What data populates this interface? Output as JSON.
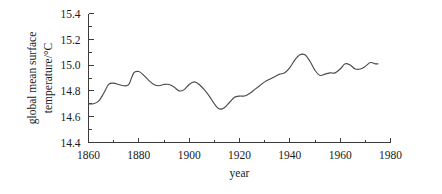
{
  "chart_data": {
    "type": "line",
    "title": "",
    "xlabel": "year",
    "ylabel": "global mean surface temperature/°C",
    "ylabel_line1": "global mean surface",
    "ylabel_line2": "temperature/°C",
    "xlim": [
      1860,
      1980
    ],
    "ylim": [
      14.4,
      15.4
    ],
    "xticks": [
      1860,
      1880,
      1900,
      1920,
      1940,
      1960,
      1980
    ],
    "xtick_labels": [
      "1860",
      "1880",
      "1900",
      "1920",
      "1940",
      "1960",
      "1980"
    ],
    "xminor_ticks": [
      1870,
      1890,
      1910,
      1930,
      1950,
      1970
    ],
    "yticks": [
      14.4,
      14.6,
      14.8,
      15.0,
      15.2,
      15.4
    ],
    "ytick_labels": [
      "14.4",
      "14.6",
      "14.8",
      "15.0",
      "15.2",
      "15.4"
    ],
    "yminor_ticks": [
      14.5,
      14.7,
      14.9,
      15.1,
      15.3
    ],
    "grid": false,
    "legend": false,
    "line_color": "#4a4a4a",
    "background_color": "#ffffff",
    "axis_color": "#3b3b3b",
    "series": [
      {
        "name": "global mean surface temperature",
        "x": [
          1860,
          1862,
          1864,
          1866,
          1868,
          1870,
          1872,
          1874,
          1876,
          1878,
          1880,
          1882,
          1884,
          1886,
          1888,
          1890,
          1892,
          1894,
          1896,
          1898,
          1900,
          1902,
          1904,
          1906,
          1908,
          1910,
          1912,
          1914,
          1916,
          1918,
          1920,
          1922,
          1924,
          1926,
          1928,
          1930,
          1932,
          1934,
          1936,
          1938,
          1940,
          1942,
          1944,
          1946,
          1948,
          1950,
          1952,
          1954,
          1956,
          1958,
          1960,
          1962,
          1964,
          1966,
          1968,
          1970,
          1972,
          1974,
          1975
        ],
        "y": [
          14.7,
          14.7,
          14.72,
          14.78,
          14.85,
          14.86,
          14.85,
          14.84,
          14.85,
          14.94,
          14.95,
          14.92,
          14.88,
          14.85,
          14.84,
          14.85,
          14.85,
          14.83,
          14.8,
          14.81,
          14.85,
          14.87,
          14.85,
          14.81,
          14.76,
          14.7,
          14.66,
          14.67,
          14.71,
          14.75,
          14.76,
          14.76,
          14.78,
          14.81,
          14.84,
          14.87,
          14.89,
          14.91,
          14.93,
          14.94,
          14.98,
          15.04,
          15.08,
          15.08,
          15.03,
          14.96,
          14.92,
          14.93,
          14.94,
          14.94,
          14.97,
          15.01,
          15.0,
          14.97,
          14.97,
          14.99,
          15.02,
          15.01,
          15.01
        ]
      }
    ]
  }
}
